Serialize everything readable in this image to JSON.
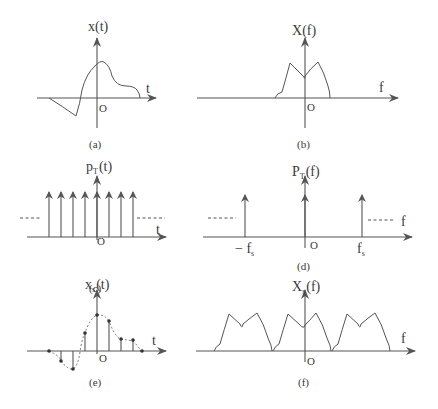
{
  "figure": {
    "panels": [
      {
        "id": "a",
        "caption": "(a)",
        "y_label_main": "x",
        "y_label_sub": "",
        "y_label_arg": "(t)",
        "x_label": "t",
        "origin_label": "O",
        "content": "continuous signal x(t)"
      },
      {
        "id": "b",
        "caption": "(b)",
        "y_label_main": "X",
        "y_label_sub": "",
        "y_label_arg": "(f)",
        "x_label": "f",
        "origin_label": "O",
        "content": "band-limited spectrum X(f)"
      },
      {
        "id": "c",
        "caption": "(c)",
        "y_label_main": "p",
        "y_label_sub": "T",
        "y_label_arg": "(t)",
        "x_label": "t",
        "origin_label": "O",
        "content": "impulse train p_T(t)",
        "impulse_count": 8
      },
      {
        "id": "d",
        "caption": "(d)",
        "y_label_main": "P",
        "y_label_sub": "T",
        "y_label_arg": "(f)",
        "x_label": "f",
        "origin_label": "O",
        "tick_labels": {
          "neg_fs_main": "− f",
          "neg_fs_sub": "s",
          "fs_main": "f",
          "fs_sub": "s"
        },
        "content": "impulse train spectrum P_T(f)"
      },
      {
        "id": "e",
        "caption": "(e)",
        "y_label_main": "x",
        "y_label_sub": "s",
        "y_label_arg": "(t)",
        "x_label": "t",
        "origin_label": "O",
        "content": "sampled signal x_s(t)",
        "sample_count": 9
      },
      {
        "id": "f",
        "caption": "(f)",
        "y_label_main": "X",
        "y_label_sub": "s",
        "y_label_arg": "(f)",
        "x_label": "f",
        "origin_label": "O",
        "content": "periodic spectrum X_s(f)",
        "replica_count": 3
      }
    ],
    "colors": {
      "line": "#555555",
      "text": "#3a3a3a",
      "background": "#ffffff"
    }
  }
}
